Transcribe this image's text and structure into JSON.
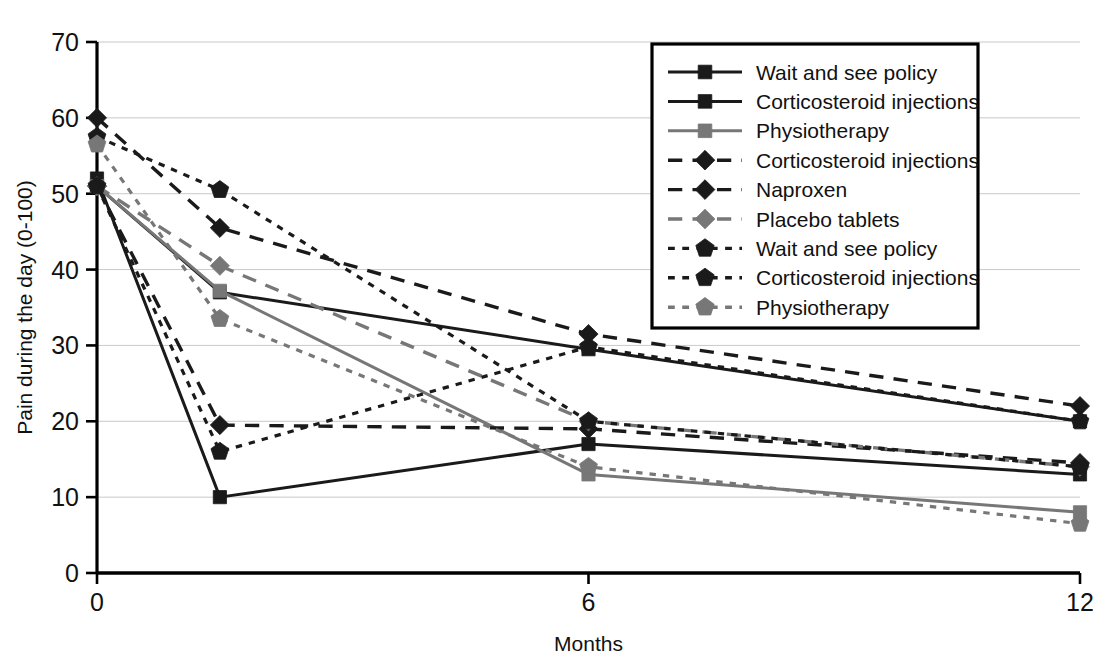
{
  "chart_data": {
    "type": "line",
    "title": "",
    "xlabel": "Months",
    "ylabel": "Pain during the day (0-100)",
    "x": [
      0,
      1.5,
      6,
      12
    ],
    "xticks": [
      0,
      6,
      12
    ],
    "xtick_labels": [
      "0",
      "6",
      "12"
    ],
    "xlim": [
      0,
      12
    ],
    "yticks": [
      0,
      10,
      20,
      30,
      40,
      50,
      60,
      70
    ],
    "ytick_labels": [
      "0",
      "10",
      "20",
      "30",
      "40",
      "50",
      "60",
      "70"
    ],
    "ylim": [
      0,
      70
    ],
    "grid": true,
    "grid_axis": "y",
    "legend_position": "top-right",
    "series": [
      {
        "name": "Wait and see policy",
        "marker": "square",
        "line": "solid",
        "color": "#1a1a1a",
        "values": [
          52,
          10,
          17,
          13
        ]
      },
      {
        "name": "Corticosteroid injections",
        "marker": "square",
        "line": "solid",
        "color": "#1a1a1a",
        "values": [
          51,
          37,
          29.5,
          20
        ]
      },
      {
        "name": "Physiotherapy",
        "marker": "square",
        "line": "solid",
        "color": "#777777",
        "values": [
          51,
          37.2,
          13,
          8
        ]
      },
      {
        "name": "Corticosteroid injections",
        "marker": "diamond",
        "line": "dashed",
        "color": "#1a1a1a",
        "values": [
          51,
          19.5,
          19,
          14.5
        ]
      },
      {
        "name": "Naproxen",
        "marker": "diamond",
        "line": "dashed",
        "color": "#1a1a1a",
        "values": [
          60,
          45.5,
          31.5,
          22
        ]
      },
      {
        "name": "Placebo tablets",
        "marker": "diamond",
        "line": "dashed",
        "color": "#777777",
        "values": [
          51,
          40.5,
          20,
          14
        ]
      },
      {
        "name": "Wait and see policy",
        "marker": "pentagon",
        "line": "dotted",
        "color": "#1a1a1a",
        "values": [
          51,
          16,
          29.8,
          20
        ]
      },
      {
        "name": "Corticosteroid injections",
        "marker": "pentagon",
        "line": "dotted",
        "color": "#1a1a1a",
        "values": [
          57.5,
          50.5,
          20,
          14
        ]
      },
      {
        "name": "Physiotherapy",
        "marker": "pentagon",
        "line": "dotted",
        "color": "#777777",
        "values": [
          56.5,
          33.5,
          14,
          6.5
        ]
      }
    ]
  },
  "legend": {
    "entries": [
      {
        "label": "Wait and see policy"
      },
      {
        "label": "Corticosteroid injections"
      },
      {
        "label": "Physiotherapy"
      },
      {
        "label": "Corticosteroid injections"
      },
      {
        "label": "Naproxen"
      },
      {
        "label": "Placebo tablets"
      },
      {
        "label": "Wait and see policy"
      },
      {
        "label": "Corticosteroid injections"
      },
      {
        "label": "Physiotherapy"
      }
    ]
  },
  "colors": {
    "dark": "#1a1a1a",
    "gray": "#777777",
    "grid": "#c9c9c9",
    "axis": "#000000",
    "background": "#ffffff"
  }
}
